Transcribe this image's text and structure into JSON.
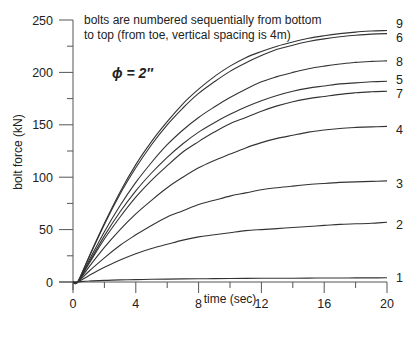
{
  "chart_data": {
    "type": "line",
    "title": "",
    "annotations": [
      "bolts are numbered sequentially from bottom",
      "to top (from toe, vertical spacing is 4m)"
    ],
    "parameter_label": "ϕ = 2″",
    "xlabel": "time (sec)",
    "ylabel": "bolt force (kN)",
    "xlim": [
      0,
      20
    ],
    "ylim": [
      0,
      250
    ],
    "xticks": [
      0,
      4,
      8,
      12,
      16,
      20
    ],
    "xminor": [
      2,
      6,
      10,
      14,
      18
    ],
    "yticks": [
      0,
      50,
      100,
      150,
      200,
      250
    ],
    "yminor": [
      25,
      75,
      125,
      175,
      225
    ],
    "grid": false,
    "legend": "inline labels at right end of each curve",
    "x": [
      0,
      0.3,
      1,
      2,
      3,
      4,
      5,
      6,
      7,
      8,
      9,
      10,
      11,
      12,
      13,
      14,
      15,
      16,
      17,
      18,
      19,
      20
    ],
    "series": [
      {
        "name": "1",
        "values": [
          0,
          0,
          1,
          1.5,
          2,
          2.3,
          2.6,
          2.8,
          3,
          3.1,
          3.2,
          3.3,
          3.4,
          3.5,
          3.6,
          3.6,
          3.7,
          3.8,
          3.8,
          3.9,
          3.9,
          4
        ]
      },
      {
        "name": "2",
        "values": [
          0,
          0,
          6,
          14,
          21,
          27,
          32,
          36,
          40,
          43,
          45,
          47,
          49,
          50,
          51,
          52,
          53,
          54,
          55,
          55.5,
          56,
          57
        ]
      },
      {
        "name": "3",
        "values": [
          0,
          0,
          10,
          23,
          35,
          45,
          54,
          62,
          68,
          74,
          78,
          82,
          85,
          88,
          90,
          91.5,
          93,
          94,
          95,
          95.5,
          96,
          96.5
        ]
      },
      {
        "name": "4",
        "values": [
          0,
          0,
          14,
          33,
          50,
          65,
          78,
          90,
          100,
          109,
          116,
          122,
          128,
          133,
          137,
          140,
          143,
          145,
          146.5,
          147.5,
          148,
          148.5
        ]
      },
      {
        "name": "7",
        "values": [
          0,
          0,
          17,
          41,
          62,
          81,
          97,
          111,
          124,
          134,
          143,
          151,
          157,
          163,
          168,
          172,
          175,
          177,
          179,
          180.5,
          181.5,
          182
        ]
      },
      {
        "name": "5",
        "values": [
          0,
          0,
          18,
          44,
          67,
          87,
          104,
          119,
          132,
          143,
          152,
          160,
          167,
          173,
          178,
          182,
          185,
          187,
          189,
          190,
          191,
          191.5
        ]
      },
      {
        "name": "8",
        "values": [
          0,
          0,
          20,
          48,
          73,
          95,
          114,
          131,
          145,
          157,
          167,
          176,
          184,
          191,
          196,
          200,
          203.5,
          206,
          208,
          209.5,
          210.5,
          211
        ]
      },
      {
        "name": "6",
        "values": [
          0,
          0,
          23,
          55,
          84,
          109,
          131,
          150,
          166,
          180,
          191,
          201,
          209,
          216,
          222,
          226,
          229.5,
          232,
          234,
          235.5,
          236.5,
          237
        ]
      },
      {
        "name": "9",
        "values": [
          0,
          0,
          23.5,
          56,
          86,
          112,
          134,
          153,
          170,
          184,
          196,
          206,
          214,
          220,
          225,
          229,
          232.5,
          235,
          237,
          238.5,
          239.5,
          240
        ]
      }
    ],
    "line_color": "#333333"
  }
}
